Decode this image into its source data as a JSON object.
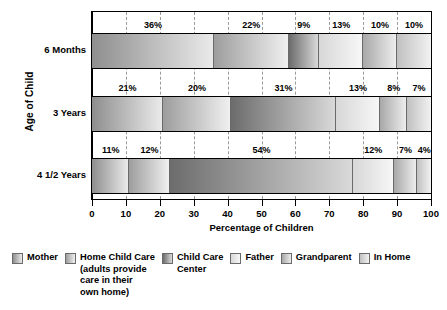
{
  "chart_data": {
    "type": "bar",
    "orientation": "horizontal",
    "stacked": true,
    "title": "",
    "xlabel": "Percentage of Children",
    "ylabel": "Age of Child",
    "xlim": [
      0,
      100
    ],
    "xticks": [
      0,
      10,
      20,
      30,
      40,
      50,
      60,
      70,
      80,
      90,
      100
    ],
    "xtick_labels": [
      "0",
      "10",
      "20",
      "30",
      "40",
      "50",
      "60",
      "70",
      "80",
      "90",
      "100"
    ],
    "grid": "vertical-dashed",
    "legend_position": "bottom",
    "categories": [
      "6 Months",
      "3 Years",
      "4 1/2 Years"
    ],
    "series": [
      {
        "name": "Mother",
        "key": "mother",
        "values": [
          36,
          21,
          11
        ]
      },
      {
        "name": "Home Child Care\n(adults provide\ncare in their\nown home)",
        "key": "home",
        "values": [
          22,
          20,
          12
        ]
      },
      {
        "name": "Child Care\nCenter",
        "key": "center",
        "values": [
          9,
          31,
          54
        ]
      },
      {
        "name": "Father",
        "key": "father",
        "values": [
          13,
          13,
          12
        ]
      },
      {
        "name": "Grandparent",
        "key": "grandparent",
        "values": [
          10,
          8,
          7
        ]
      },
      {
        "name": "In Home",
        "key": "inhome",
        "values": [
          10,
          7,
          4
        ]
      }
    ],
    "value_labels": {
      "6 Months": [
        "36%",
        "22%",
        "9%",
        "13%",
        "10%",
        "10%"
      ],
      "3 Years": [
        "21%",
        "20%",
        "31%",
        "13%",
        "8%",
        "7%"
      ],
      "4 1/2 Years": [
        "11%",
        "12%",
        "54%",
        "12%",
        "7%",
        "4%"
      ]
    },
    "colors": {
      "mother": {
        "dark": "#8e8e8e",
        "light": "#eaeaea"
      },
      "home": {
        "dark": "#9d9d9d",
        "light": "#f0f0f0"
      },
      "center": {
        "dark": "#6c6c6c",
        "light": "#d9d9d9"
      },
      "father": {
        "dark": "#d7d7d7",
        "light": "#f7f7f7"
      },
      "grandparent": {
        "dark": "#a8a8a8",
        "light": "#ededed"
      },
      "inhome": {
        "dark": "#c0c0c0",
        "light": "#f2f2f2"
      }
    }
  },
  "axis": {
    "y_title": "Age of Child",
    "x_title": "Percentage of Children",
    "categories": [
      {
        "label": "6 Months"
      },
      {
        "label": "3 Years"
      },
      {
        "label": "4 1/2 Years"
      }
    ],
    "ticks": [
      {
        "label": "0"
      },
      {
        "label": "10"
      },
      {
        "label": "20"
      },
      {
        "label": "30"
      },
      {
        "label": "40"
      },
      {
        "label": "50"
      },
      {
        "label": "60"
      },
      {
        "label": "70"
      },
      {
        "label": "80"
      },
      {
        "label": "90"
      },
      {
        "label": "100"
      }
    ]
  },
  "legend": {
    "items": [
      {
        "label": "Mother",
        "key": "mother"
      },
      {
        "label": "Home Child Care\n(adults provide\ncare in their\nown home)",
        "key": "home"
      },
      {
        "label": "Child Care\nCenter",
        "key": "center"
      },
      {
        "label": "Father",
        "key": "father"
      },
      {
        "label": "Grandparent",
        "key": "grandparent"
      },
      {
        "label": "In Home",
        "key": "inhome"
      }
    ]
  }
}
